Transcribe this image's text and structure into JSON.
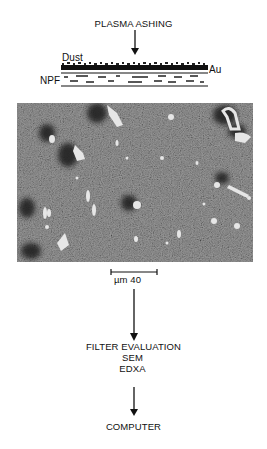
{
  "flow": {
    "step1": "PLASMA ASHING",
    "step2_lines": [
      "FILTER EVALUATION",
      "SEM",
      "EDXA"
    ],
    "step3": "COMPUTER"
  },
  "filter_diagram": {
    "dust_label": "Dust",
    "gold_label": "Au",
    "filter_label": "NPF"
  },
  "micrograph": {
    "description": "SEM micrograph of dust particles on gold-coated filter",
    "scale_bar_label": "µm 40",
    "colors": {
      "background": "#6a6a6a",
      "dark_particle": "#1e1e1e",
      "bright_particle": "#e6e6e6"
    }
  }
}
